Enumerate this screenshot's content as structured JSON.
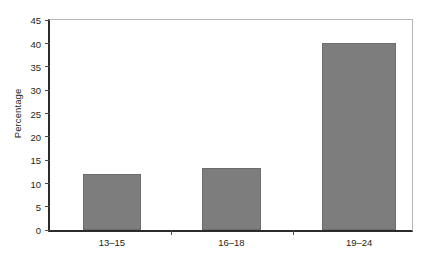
{
  "chart_data": {
    "type": "bar",
    "title": "",
    "xlabel": "",
    "ylabel": "Percentage",
    "categories": [
      "13–15",
      "16–18",
      "19–24"
    ],
    "values": [
      12,
      13.3,
      40
    ],
    "ylim": [
      0,
      45
    ],
    "yticks": [
      0,
      5,
      10,
      15,
      20,
      25,
      30,
      35,
      40,
      45
    ],
    "ytick_labels": [
      "0",
      "5",
      "10",
      "15",
      "20",
      "25",
      "30",
      "35",
      "40",
      "45"
    ],
    "grid": false,
    "legend": null,
    "bar_color": "#7d7d7d",
    "bar_edge_color": "#6d6d6d",
    "axis_color": "#2b2b2b",
    "frame_color": "#b7b7b7",
    "text_color": "#231f20",
    "bars": [
      {
        "category": "13–15",
        "value": 12,
        "left_pct": 9.0,
        "width_pct": 16.2
      },
      {
        "category": "16–18",
        "value": 13.3,
        "left_pct": 42.0,
        "width_pct": 16.2
      },
      {
        "category": "19–24",
        "value": 40,
        "left_pct": 75.2,
        "width_pct": 20.3
      }
    ],
    "category_centers_pct": [
      17.1,
      50.1,
      85.4
    ],
    "separator_positions_pct": [
      33.4,
      67.0
    ]
  }
}
